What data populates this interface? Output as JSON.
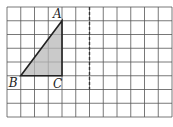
{
  "diagram": {
    "grid": {
      "cols": 12,
      "rows": 8,
      "left": 7,
      "top": 7,
      "cell": 13.75
    },
    "axis_line": {
      "x": 6,
      "style": "dashed"
    },
    "triangle": {
      "points": {
        "A": [
          4,
          1
        ],
        "B": [
          1,
          5
        ],
        "C": [
          4,
          5
        ]
      },
      "fill": "#b8b8b8"
    },
    "labels": {
      "A": "A",
      "B": "B",
      "C": "C"
    }
  }
}
